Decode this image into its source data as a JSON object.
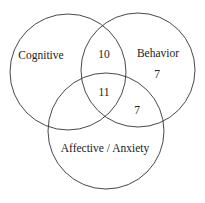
{
  "diagram": {
    "type": "venn",
    "stroke_color": "#333333",
    "sets": [
      {
        "label": "Cognitive",
        "cx": 68,
        "cy": 72,
        "r": 58
      },
      {
        "label": "Behavior",
        "cx": 138,
        "cy": 70,
        "r": 57
      },
      {
        "label": "Affective / Anxiety",
        "cx": 106,
        "cy": 131,
        "r": 58
      }
    ],
    "regions": {
      "cognitive_behavior": "10",
      "behavior_only": "7",
      "all_three": "11",
      "behavior_affective": "7"
    }
  }
}
